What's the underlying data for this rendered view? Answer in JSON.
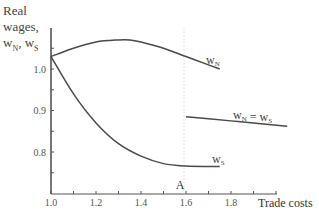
{
  "chart_data": {
    "type": "line",
    "title": "",
    "xlabel": "Trade costs",
    "ylabel": "Real wages, wN, wS",
    "xlim": [
      1.0,
      2.0
    ],
    "ylim": [
      0.7,
      1.1
    ],
    "x_ticks": [
      "1.0",
      "1.2",
      "1.4",
      "1.6",
      "1.8"
    ],
    "y_ticks": [
      "0.8",
      "0.9",
      "1.0"
    ],
    "grid": false,
    "annotations": [
      {
        "text": "A",
        "x": 1.6,
        "note": "dotted vertical line at trade costs ≈ 1.6 marking regime switch"
      }
    ],
    "series": [
      {
        "name": "wN",
        "label": "wN",
        "x": [
          1.0,
          1.1,
          1.2,
          1.3,
          1.35,
          1.4,
          1.5,
          1.6,
          1.7,
          1.75
        ],
        "y": [
          1.03,
          1.05,
          1.065,
          1.07,
          1.07,
          1.065,
          1.05,
          1.03,
          1.01,
          1.0
        ]
      },
      {
        "name": "wS",
        "label": "wS",
        "x": [
          1.0,
          1.1,
          1.2,
          1.3,
          1.4,
          1.5,
          1.6,
          1.7,
          1.75
        ],
        "y": [
          1.03,
          0.94,
          0.87,
          0.82,
          0.79,
          0.772,
          0.766,
          0.765,
          0.765
        ]
      },
      {
        "name": "wN = wS",
        "label": "wN = wS",
        "x": [
          1.6,
          1.7,
          1.8,
          1.9,
          2.05
        ],
        "y": [
          0.885,
          0.88,
          0.875,
          0.87,
          0.862
        ]
      }
    ]
  },
  "labels": {
    "ylabel_line1": "Real",
    "ylabel_line2": "wages,",
    "ylabel_w1": "w",
    "ylabel_sub1": "N",
    "ylabel_sep": ", w",
    "ylabel_sub2": "S",
    "xlabel": "Trade costs",
    "annotation_a": "A",
    "wN": "w",
    "wN_sub": "N",
    "wS": "w",
    "wS_sub": "S",
    "eq_w1": "w",
    "eq_sub1": "N",
    "eq_mid": " = w",
    "eq_sub2": "S"
  }
}
